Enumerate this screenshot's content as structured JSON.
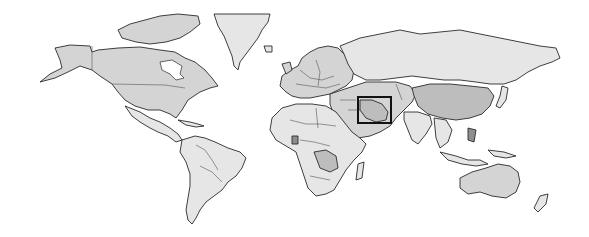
{
  "map": {
    "type": "world political map",
    "style": "grayscale choropleth",
    "colors": {
      "background": "#ffffff",
      "border": "#2a2a2a",
      "shade_light": "#e6e6e6",
      "shade_mid": "#d4d4d4",
      "shade_dark": "#bdbdbd",
      "shade_darkest": "#8e8e8e",
      "highlight_box": "#111111"
    },
    "highlight": {
      "region": "Iran",
      "box": {
        "x": 357,
        "y": 96,
        "width": 35,
        "height": 28
      }
    },
    "regions": [
      {
        "name": "North America",
        "shade": "shade_mid"
      },
      {
        "name": "Greenland",
        "shade": "shade_light"
      },
      {
        "name": "South America",
        "shade": "shade_light"
      },
      {
        "name": "Europe",
        "shade": "shade_mid"
      },
      {
        "name": "Russia",
        "shade": "shade_light"
      },
      {
        "name": "Africa",
        "shade": "shade_light"
      },
      {
        "name": "Middle East",
        "shade": "shade_mid"
      },
      {
        "name": "China",
        "shade": "shade_dark"
      },
      {
        "name": "India",
        "shade": "shade_light"
      },
      {
        "name": "Southeast Asia",
        "shade": "shade_light"
      },
      {
        "name": "Australia",
        "shade": "shade_mid"
      },
      {
        "name": "New Zealand",
        "shade": "shade_light"
      }
    ]
  }
}
